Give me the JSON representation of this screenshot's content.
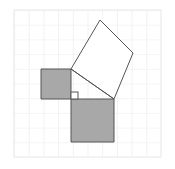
{
  "figure": {
    "canvas": {
      "width": 175,
      "height": 169,
      "background": "#ffffff"
    }
  },
  "grid": {
    "x": 14,
    "y": 10,
    "width": 147,
    "height": 147,
    "cell_size": 14.7,
    "columns": 10,
    "rows": 10,
    "line_color": "#ebebeb",
    "line_width": 1,
    "background": "#ffffff"
  },
  "colors": {
    "shaded_fill": "#a8a8a8",
    "unshaded_fill": "#ffffff",
    "outline": "#555555",
    "grid_line": "#ebebeb",
    "marker_fill": "#ffffff"
  },
  "chart_data": {
    "type": "diagram",
    "grid": {
      "on": true,
      "cell_size": 14.7,
      "columns": 10,
      "rows": 10
    },
    "triangle": {
      "label": "right triangle",
      "vertices": [
        [
          71,
          99
        ],
        [
          71,
          69
        ],
        [
          114,
          99
        ]
      ],
      "right_angle_vertex": [
        71,
        99
      ]
    },
    "shapes": [
      {
        "name": "small-shaded-square",
        "label": "Square on vertical leg (a)",
        "fill": "shaded",
        "side_px": 30,
        "vertices": [
          [
            41,
            69
          ],
          [
            71,
            69
          ],
          [
            71,
            99
          ],
          [
            41,
            99
          ]
        ]
      },
      {
        "name": "large-shaded-square",
        "label": "Square on horizontal leg (b)",
        "fill": "shaded",
        "side_px": 43,
        "vertices": [
          [
            71,
            99
          ],
          [
            114,
            99
          ],
          [
            114,
            142
          ],
          [
            71,
            142
          ]
        ]
      },
      {
        "name": "white-rotated-square",
        "label": "Square on hypotenuse (c)",
        "fill": "unshaded",
        "side_px": 52,
        "rotated": true,
        "vertices": [
          [
            71,
            69
          ],
          [
            100,
            20
          ],
          [
            133,
            53
          ],
          [
            114,
            99
          ]
        ]
      }
    ],
    "markers": [
      {
        "name": "right-angle-marker",
        "label": "right angle",
        "x": 71,
        "y": 92,
        "size": 7
      }
    ]
  }
}
